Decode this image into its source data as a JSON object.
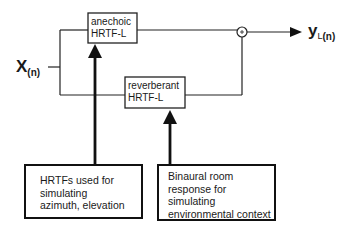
{
  "diagram": {
    "input": {
      "symbol": "X",
      "subscript": "(n)"
    },
    "output": {
      "symbol": "y",
      "channel": "L",
      "subscript": "(n)"
    },
    "blocks": [
      {
        "id": "anechoic",
        "lines": [
          "anechoic",
          "HRTF-L"
        ]
      },
      {
        "id": "reverberant",
        "lines": [
          "reverberant",
          "HRTF-L"
        ]
      }
    ],
    "summing_node": {
      "symbol": "+"
    },
    "annotations": [
      {
        "id": "hrtf-note",
        "lines": [
          "HRTFs used for",
          "simulating",
          "azimuth, elevation"
        ]
      },
      {
        "id": "brir-note",
        "lines": [
          "Binaural room",
          "response for",
          "simulating",
          "environmental context"
        ]
      }
    ]
  }
}
